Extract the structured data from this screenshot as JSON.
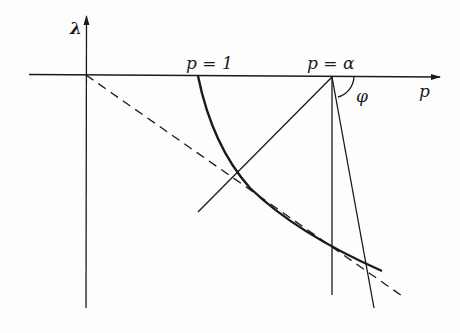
{
  "diagram": {
    "axes": {
      "vertical_label": "λ",
      "horizontal_label": "p"
    },
    "labels": {
      "p_equals_1": "p = 1",
      "p_equals_alpha": "p = α",
      "angle": "φ"
    },
    "colors": {
      "stroke": "#1a1a1a",
      "background": "#fdfdfd"
    }
  }
}
